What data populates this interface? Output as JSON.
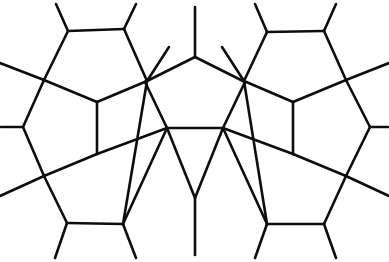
{
  "figure": {
    "name": "pentagonal-tiling",
    "type": "line-diagram",
    "width": 389,
    "height": 262,
    "background_color": "#ffffff",
    "line_color": "#0d0d0d",
    "line_width": 2.6
  },
  "chart_data": {
    "type": "line-diagram",
    "xlabel": "",
    "ylabel": "",
    "xlim": [
      0,
      389
    ],
    "ylim": [
      0,
      262
    ],
    "grid": false,
    "legend": "none",
    "vertices": {
      "top_left_pent_tl": [
        68,
        31
      ],
      "top_left_pent_tr": [
        124,
        29
      ],
      "top_left_pent_bl": [
        44,
        80
      ],
      "top_left_pent_br": [
        147,
        81
      ],
      "top_left_pent_b": [
        97,
        102
      ],
      "top_right_pent_tl": [
        267,
        32
      ],
      "top_right_pent_tr": [
        324,
        31
      ],
      "top_right_pent_bl": [
        244,
        81
      ],
      "top_right_pent_br": [
        346,
        80
      ],
      "top_right_pent_b": [
        293,
        102
      ],
      "center_top": [
        195,
        57
      ],
      "center_left": [
        145,
        82
      ],
      "center_right": [
        245,
        82
      ],
      "center_bl": [
        167,
        128
      ],
      "center_br": [
        223,
        128
      ],
      "left_mid": [
        23,
        127
      ],
      "right_mid": [
        370,
        127
      ],
      "left_lower": [
        97,
        154
      ],
      "right_lower": [
        293,
        154
      ],
      "bottom_left_cross": [
        44,
        176
      ],
      "bottom_right_cross": [
        346,
        176
      ],
      "bottom_center": [
        195,
        198
      ],
      "bl_pent_bl": [
        67,
        223
      ],
      "bl_pent_br": [
        123,
        224
      ],
      "br_pent_bl": [
        267,
        224
      ],
      "br_pent_br": [
        324,
        224
      ]
    },
    "edges": [
      [
        [
          68,
          31
        ],
        [
          124,
          29
        ]
      ],
      [
        [
          68,
          31
        ],
        [
          44,
          80
        ]
      ],
      [
        [
          124,
          29
        ],
        [
          147,
          81
        ]
      ],
      [
        [
          44,
          80
        ],
        [
          97,
          102
        ]
      ],
      [
        [
          97,
          102
        ],
        [
          147,
          81
        ]
      ],
      [
        [
          267,
          32
        ],
        [
          324,
          31
        ]
      ],
      [
        [
          267,
          32
        ],
        [
          244,
          81
        ]
      ],
      [
        [
          324,
          31
        ],
        [
          346,
          80
        ]
      ],
      [
        [
          244,
          81
        ],
        [
          293,
          102
        ]
      ],
      [
        [
          293,
          102
        ],
        [
          346,
          80
        ]
      ],
      [
        [
          195,
          57
        ],
        [
          145,
          82
        ]
      ],
      [
        [
          195,
          57
        ],
        [
          245,
          82
        ]
      ],
      [
        [
          145,
          82
        ],
        [
          167,
          128
        ]
      ],
      [
        [
          245,
          82
        ],
        [
          223,
          128
        ]
      ],
      [
        [
          167,
          128
        ],
        [
          223,
          128
        ]
      ],
      [
        [
          44,
          80
        ],
        [
          23,
          127
        ]
      ],
      [
        [
          23,
          127
        ],
        [
          44,
          176
        ]
      ],
      [
        [
          97,
          102
        ],
        [
          97,
          154
        ]
      ],
      [
        [
          97,
          154
        ],
        [
          44,
          176
        ]
      ],
      [
        [
          97,
          154
        ],
        [
          167,
          128
        ]
      ],
      [
        [
          346,
          80
        ],
        [
          370,
          127
        ]
      ],
      [
        [
          370,
          127
        ],
        [
          346,
          176
        ]
      ],
      [
        [
          293,
          102
        ],
        [
          293,
          154
        ]
      ],
      [
        [
          293,
          154
        ],
        [
          346,
          176
        ]
      ],
      [
        [
          293,
          154
        ],
        [
          223,
          128
        ]
      ],
      [
        [
          44,
          176
        ],
        [
          67,
          223
        ]
      ],
      [
        [
          67,
          223
        ],
        [
          123,
          224
        ]
      ],
      [
        [
          123,
          224
        ],
        [
          167,
          128
        ]
      ],
      [
        [
          346,
          176
        ],
        [
          324,
          224
        ]
      ],
      [
        [
          324,
          224
        ],
        [
          267,
          224
        ]
      ],
      [
        [
          267,
          224
        ],
        [
          223,
          128
        ]
      ],
      [
        [
          167,
          128
        ],
        [
          195,
          198
        ]
      ],
      [
        [
          223,
          128
        ],
        [
          195,
          198
        ]
      ]
    ],
    "boundary_stubs": [
      [
        [
          68,
          31
        ],
        [
          56,
          4
        ]
      ],
      [
        [
          124,
          29
        ],
        [
          136,
          4
        ]
      ],
      [
        [
          195,
          57
        ],
        [
          195,
          7
        ]
      ],
      [
        [
          267,
          32
        ],
        [
          255,
          4
        ]
      ],
      [
        [
          324,
          31
        ],
        [
          336,
          4
        ]
      ],
      [
        [
          44,
          80
        ],
        [
          0,
          63
        ]
      ],
      [
        [
          147,
          81
        ],
        [
          169,
          47
        ]
      ],
      [
        [
          244,
          81
        ],
        [
          222,
          47
        ]
      ],
      [
        [
          346,
          80
        ],
        [
          389,
          63
        ]
      ],
      [
        [
          23,
          127
        ],
        [
          1,
          127
        ]
      ],
      [
        [
          370,
          127
        ],
        [
          388,
          127
        ]
      ],
      [
        [
          44,
          176
        ],
        [
          0,
          196
        ]
      ],
      [
        [
          346,
          176
        ],
        [
          389,
          196
        ]
      ],
      [
        [
          147,
          81
        ],
        [
          123,
          224
        ]
      ],
      [
        [
          244,
          81
        ],
        [
          267,
          224
        ]
      ],
      [
        [
          67,
          223
        ],
        [
          55,
          258
        ]
      ],
      [
        [
          123,
          224
        ],
        [
          136,
          258
        ]
      ],
      [
        [
          195,
          198
        ],
        [
          195,
          255
        ]
      ],
      [
        [
          267,
          224
        ],
        [
          255,
          258
        ]
      ],
      [
        [
          324,
          224
        ],
        [
          336,
          258
        ]
      ]
    ]
  }
}
